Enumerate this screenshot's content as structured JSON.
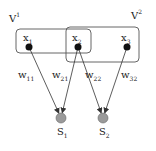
{
  "diagram": {
    "groups": [
      {
        "id": "V1",
        "label": "V",
        "superscript": "1",
        "box": {
          "x": 16,
          "y": 29,
          "w": 75,
          "h": 24
        },
        "label_pos": {
          "x": 9,
          "y": 22
        }
      },
      {
        "id": "V2",
        "label": "V",
        "superscript": "2",
        "box": {
          "x": 66,
          "y": 27,
          "w": 73,
          "h": 35
        },
        "label_pos": {
          "x": 131,
          "y": 19
        }
      }
    ],
    "input_nodes": [
      {
        "id": "x1",
        "label": "x",
        "subscript": "1",
        "cx": 29,
        "cy": 47
      },
      {
        "id": "x2",
        "label": "x",
        "subscript": "2",
        "cx": 78,
        "cy": 47
      },
      {
        "id": "x3",
        "label": "x",
        "subscript": "3",
        "cx": 127,
        "cy": 47
      }
    ],
    "output_nodes": [
      {
        "id": "S1",
        "label": "S",
        "subscript": "1",
        "cx": 61,
        "cy": 118
      },
      {
        "id": "S2",
        "label": "S",
        "subscript": "2",
        "cx": 103,
        "cy": 118
      }
    ],
    "edges": [
      {
        "from": "x1",
        "to": "S1",
        "label": "w",
        "subscript": "11",
        "lx": 18,
        "ly": 78
      },
      {
        "from": "x2",
        "to": "S1",
        "label": "w",
        "subscript": "21",
        "lx": 52,
        "ly": 78
      },
      {
        "from": "x2",
        "to": "S2",
        "label": "w",
        "subscript": "22",
        "lx": 85,
        "ly": 78
      },
      {
        "from": "x3",
        "to": "S2",
        "label": "w",
        "subscript": "32",
        "lx": 121,
        "ly": 78
      }
    ],
    "colors": {
      "stroke": "#333333",
      "input_fill": "#111111",
      "output_fill": "#9a9a9a",
      "box_stroke": "#555555"
    }
  }
}
